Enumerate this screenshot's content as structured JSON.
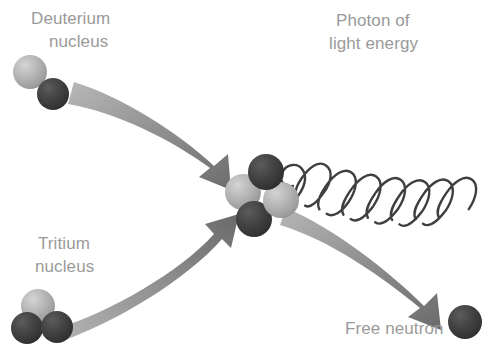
{
  "diagram": {
    "background_color": "#ffffff",
    "label_color": "#9a9a9a",
    "arrow_color_light": "#b2b2b2",
    "arrow_color_dark": "#6e6e6e",
    "wave_color": "#3f3f3f",
    "proton_color": "#b0b0b0",
    "neutron_color": "#3c3c3c"
  },
  "labels": {
    "deuterium_line1": "Deuterium",
    "deuterium_line2": "nucleus",
    "photon_line1": "Photon of",
    "photon_line2": "light energy",
    "tritium_line1": "Tritium",
    "tritium_line2": "nucleus",
    "free_neutron": "Free neutron"
  },
  "particles": {
    "deuterium": [
      {
        "name": "proton",
        "shade": "light",
        "cx": 30,
        "cy": 72,
        "r": 17
      },
      {
        "name": "neutron",
        "shade": "dark",
        "cx": 53,
        "cy": 94,
        "r": 16
      }
    ],
    "tritium": [
      {
        "name": "proton",
        "shade": "light",
        "cx": 38,
        "cy": 306,
        "r": 17
      },
      {
        "name": "neutron",
        "shade": "dark",
        "cx": 27,
        "cy": 328,
        "r": 16
      },
      {
        "name": "neutron",
        "shade": "dark",
        "cx": 57,
        "cy": 327,
        "r": 16
      }
    ],
    "helium_nucleus": [
      {
        "name": "neutron",
        "shade": "dark",
        "cx": 266,
        "cy": 172,
        "r": 18
      },
      {
        "name": "proton",
        "shade": "light",
        "cx": 243,
        "cy": 192,
        "r": 18
      },
      {
        "name": "proton",
        "shade": "light",
        "cx": 281,
        "cy": 200,
        "r": 18
      },
      {
        "name": "neutron",
        "shade": "dark",
        "cx": 254,
        "cy": 219,
        "r": 18
      }
    ],
    "free_neutron": [
      {
        "name": "neutron",
        "shade": "dark",
        "cx": 465,
        "cy": 322,
        "r": 17
      }
    ]
  },
  "arrows": [
    {
      "id": "deuterium-to-nucleus",
      "from": "Deuterium nucleus",
      "to": "Fused nucleus",
      "direction": "down-right"
    },
    {
      "id": "tritium-to-nucleus",
      "from": "Tritium nucleus",
      "to": "Fused nucleus",
      "direction": "up-right"
    },
    {
      "id": "nucleus-to-neutron",
      "from": "Fused nucleus",
      "to": "Free neutron",
      "direction": "down-right"
    }
  ],
  "photon_wave": {
    "id": "photon-helix",
    "loops": 8,
    "from": "Fused nucleus",
    "direction": "up-right"
  }
}
